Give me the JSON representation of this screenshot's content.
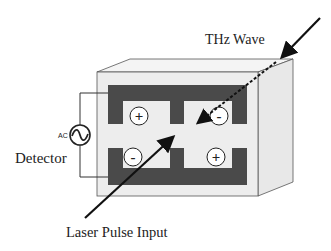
{
  "diagram": {
    "labels": {
      "thz_wave": "THz Wave",
      "detector": "Detector",
      "ac": "AC",
      "laser_input": "Laser Pulse Input"
    },
    "charges": {
      "top_left": "+",
      "top_right": "-",
      "bottom_left": "-",
      "bottom_right": "+"
    },
    "colors": {
      "electrode": "#4a4a4a",
      "substrate_front": "#ededed",
      "substrate_top": "#f4f4f4",
      "substrate_side": "#e8e8e8",
      "outline": "#555555",
      "arrow": "#111111"
    }
  }
}
